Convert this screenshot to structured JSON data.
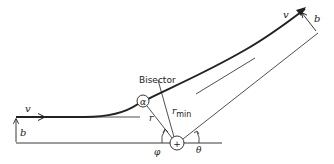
{
  "diagram": {
    "labels": {
      "v_in": "v",
      "v_out": "v",
      "b_in": "b",
      "b_out": "b",
      "bisector": "Bisector",
      "alpha": "α",
      "r": "r",
      "r_min_r": "r",
      "r_min_sub": "min",
      "phi": "φ",
      "theta": "θ",
      "nucleus": "+"
    },
    "colors": {
      "stroke": "#222222",
      "background": "#ffffff"
    }
  }
}
